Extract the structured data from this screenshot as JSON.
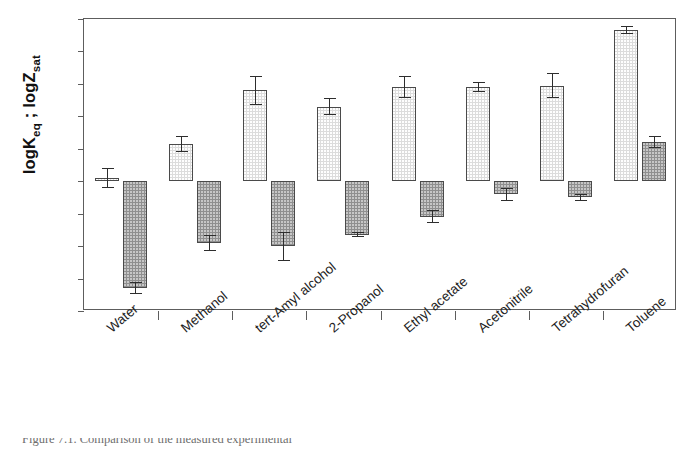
{
  "chart_data": {
    "type": "bar",
    "title": "",
    "xlabel": "",
    "ylabel": "logKeq ; logZsat",
    "ylabel_parts": {
      "seg1": "logK",
      "sub1": "eq",
      "seg2": " ; logZ",
      "sub2": "sat"
    },
    "ylim": [
      -4,
      5
    ],
    "yticks": [
      5,
      4,
      3,
      2,
      1,
      0,
      -1,
      -2,
      -3,
      -4
    ],
    "ytick_labels": [
      "5",
      "4",
      "3",
      "2",
      "1",
      "0",
      "-1",
      "-2",
      "-3",
      "-4"
    ],
    "grid": false,
    "legend": "none",
    "categories": [
      "Water",
      "Methanol",
      "tert-Amyl alcohol",
      "2-Propanol",
      "Ethyl acetate",
      "Acetonitrile",
      "Tetrahydrofuran",
      "Toluene"
    ],
    "series": [
      {
        "name": "logKeq",
        "fill": "light-gray-dotted",
        "color": "#dcdcdc",
        "values": [
          0.1,
          1.15,
          2.8,
          2.3,
          2.9,
          2.9,
          2.95,
          4.65
        ],
        "errors": [
          0.3,
          0.25,
          0.45,
          0.25,
          0.35,
          0.15,
          0.4,
          0.12
        ]
      },
      {
        "name": "logZsat",
        "fill": "dark-gray-dotted",
        "color": "#8f8f8f",
        "values": [
          -3.3,
          -1.9,
          -2.0,
          -1.65,
          -1.1,
          -0.4,
          -0.5,
          1.2
        ],
        "errors": [
          0.18,
          0.25,
          0.45,
          0.08,
          0.2,
          0.2,
          0.1,
          0.18
        ]
      }
    ]
  },
  "caption": {
    "text": "Figure 7.1.  Comparison of the measured experimental"
  }
}
